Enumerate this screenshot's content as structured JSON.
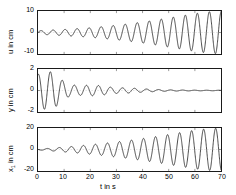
{
  "figure": {
    "type": "multi-panel-time-series",
    "background": "#ffffff",
    "line_color": "#1a1a1a",
    "axis_color": "#1a1a1a",
    "grid_color": "#bfbfbf"
  },
  "xaxis": {
    "label": "t in s",
    "ticks": [
      "0",
      "10",
      "20",
      "30",
      "40",
      "50",
      "60",
      "70"
    ],
    "min": 0,
    "max": 70
  },
  "panels": [
    {
      "id": "panel-u",
      "ylabel_main": "u in cm",
      "ylabel_var": "u",
      "ylabel_unit": "in cm",
      "yticks": [
        "10",
        "0",
        "-10"
      ],
      "ymin": -10,
      "ymax": 10,
      "show_xticks": false
    },
    {
      "id": "panel-y",
      "ylabel_main": "y in cm",
      "ylabel_var": "y",
      "ylabel_unit": "in cm",
      "yticks": [
        "2",
        "0",
        "-2"
      ],
      "ymin": -2,
      "ymax": 2,
      "show_xticks": false
    },
    {
      "id": "panel-x1",
      "ylabel_main": "x1 in cm",
      "ylabel_var": "x",
      "ylabel_sub": "1",
      "ylabel_unit": "in cm",
      "yticks": [
        "20",
        "0",
        "-20"
      ],
      "ymin": -20,
      "ymax": 20,
      "show_xticks": true
    }
  ],
  "chart_data": {
    "type": "line",
    "title": "",
    "xlabel": "t in s",
    "xlim": [
      0,
      70
    ],
    "grid": true,
    "legend": "none",
    "subplots": [
      {
        "name": "u",
        "ylabel": "u in cm",
        "ylim": [
          -10,
          10
        ],
        "yticks": [
          10,
          0,
          -10
        ],
        "description": "Oscillation with monotonically growing envelope; amplitude ~1 cm near t=0 rising to ~10 cm at t=70. Period roughly 4.5 s.",
        "envelope": [
          {
            "t": 0,
            "a": 0.8
          },
          {
            "t": 5,
            "a": 1.1
          },
          {
            "t": 10,
            "a": 1.4
          },
          {
            "t": 15,
            "a": 1.8
          },
          {
            "t": 20,
            "a": 2.2
          },
          {
            "t": 25,
            "a": 2.8
          },
          {
            "t": 30,
            "a": 3.4
          },
          {
            "t": 35,
            "a": 4.1
          },
          {
            "t": 40,
            "a": 4.9
          },
          {
            "t": 45,
            "a": 5.8
          },
          {
            "t": 50,
            "a": 6.8
          },
          {
            "t": 55,
            "a": 7.8
          },
          {
            "t": 60,
            "a": 8.8
          },
          {
            "t": 65,
            "a": 9.6
          },
          {
            "t": 70,
            "a": 10.0
          }
        ],
        "period": 4.6,
        "phase": 0.0
      },
      {
        "name": "y",
        "ylabel": "y in cm",
        "ylim": [
          -2,
          2
        ],
        "yticks": [
          2,
          0,
          -2
        ],
        "description": "Strongly damped oscillation. Starts near +1.5 cm, large swings to -1.8 cm around t=5, decaying to near zero by t=45 and flat thereafter.",
        "envelope": [
          {
            "t": 0,
            "a": 1.5
          },
          {
            "t": 3,
            "a": 1.8
          },
          {
            "t": 6,
            "a": 1.7
          },
          {
            "t": 9,
            "a": 1.0
          },
          {
            "t": 12,
            "a": 0.55
          },
          {
            "t": 16,
            "a": 0.45
          },
          {
            "t": 20,
            "a": 0.5
          },
          {
            "t": 24,
            "a": 0.45
          },
          {
            "t": 28,
            "a": 0.3
          },
          {
            "t": 32,
            "a": 0.25
          },
          {
            "t": 36,
            "a": 0.22
          },
          {
            "t": 40,
            "a": 0.15
          },
          {
            "t": 45,
            "a": 0.1
          },
          {
            "t": 50,
            "a": 0.06
          },
          {
            "t": 60,
            "a": 0.03
          },
          {
            "t": 70,
            "a": 0.02
          }
        ],
        "period": 4.6,
        "phase": 1.4
      },
      {
        "name": "x1",
        "ylabel": "x1 in cm",
        "ylim": [
          -20,
          20
        ],
        "yticks": [
          20,
          0,
          -20
        ],
        "description": "Oscillation with growing envelope; nearly flat until t~5, then amplitude grows to ~20 cm at t=70. Period roughly 4.5 s.",
        "envelope": [
          {
            "t": 0,
            "a": 0.4
          },
          {
            "t": 5,
            "a": 1.2
          },
          {
            "t": 10,
            "a": 2.2
          },
          {
            "t": 15,
            "a": 3.2
          },
          {
            "t": 20,
            "a": 4.4
          },
          {
            "t": 25,
            "a": 5.6
          },
          {
            "t": 30,
            "a": 7.0
          },
          {
            "t": 35,
            "a": 8.5
          },
          {
            "t": 40,
            "a": 10.2
          },
          {
            "t": 45,
            "a": 12.0
          },
          {
            "t": 50,
            "a": 14.0
          },
          {
            "t": 55,
            "a": 16.0
          },
          {
            "t": 60,
            "a": 18.0
          },
          {
            "t": 65,
            "a": 19.4
          },
          {
            "t": 70,
            "a": 20.0
          }
        ],
        "period": 4.6,
        "phase": 3.0
      }
    ]
  }
}
